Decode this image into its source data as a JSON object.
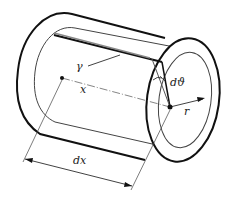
{
  "diagram": {
    "labels": {
      "gamma": "γ",
      "x": "x",
      "dtheta": "dϑ",
      "r": "r",
      "dx": "dx"
    },
    "colors": {
      "outline": "#111111",
      "thin": "#444444",
      "generator": "#888888",
      "background": "#ffffff"
    }
  }
}
